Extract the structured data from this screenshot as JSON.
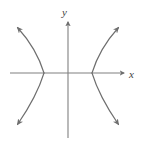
{
  "figure": {
    "kind": "coordinate-plane-graph",
    "background_color": "#ffffff",
    "width": 143,
    "height": 145
  },
  "axes": {
    "stroke_color": "#808080",
    "stroke_width": 1.1,
    "origin": {
      "x": 68,
      "y": 73
    },
    "x_axis": {
      "label": "x",
      "label_position": {
        "x": 131,
        "y": 74
      },
      "start": {
        "x": 10,
        "y": 73
      },
      "end": {
        "x": 126,
        "y": 73
      },
      "arrow": "right"
    },
    "y_axis": {
      "label": "y",
      "label_position": {
        "x": 66,
        "y": 13
      },
      "start": {
        "x": 68,
        "y": 138
      },
      "end": {
        "x": 68,
        "y": 20
      },
      "arrow": "up"
    }
  },
  "curve": {
    "type": "hyperbola",
    "orientation": "horizontal",
    "stroke_color": "#6e6e6e",
    "stroke_width": 1.1,
    "center": {
      "x": 68,
      "y": 73
    },
    "vertices": [
      {
        "x": 44,
        "y": 73
      },
      {
        "x": 92,
        "y": 73
      }
    ],
    "branches": [
      {
        "name": "left-branch",
        "path": "M 16 28 C 26 41, 38 56, 44 73 C 38 90, 26 107, 16 126",
        "arrow_tips": [
          {
            "x": 14,
            "y": 26
          },
          {
            "x": 14,
            "y": 128
          }
        ]
      },
      {
        "name": "right-branch",
        "path": "M 120 28 C 110 41, 98 56, 92 73 C 98 90, 110 107, 120 126",
        "arrow_tips": [
          {
            "x": 122,
            "y": 26
          },
          {
            "x": 122,
            "y": 128
          }
        ]
      }
    ]
  }
}
